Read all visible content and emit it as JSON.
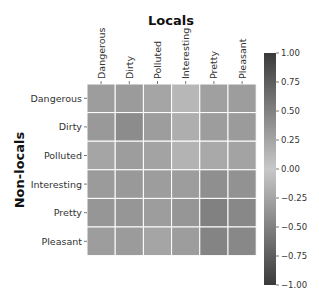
{
  "chart_data": {
    "type": "heatmap",
    "title": "Locals",
    "xlabel": "Locals",
    "ylabel": "Non-locals",
    "x_categories": [
      "Dangerous",
      "Dirty",
      "Polluted",
      "Interesting",
      "Pretty",
      "Pleasant"
    ],
    "y_categories": [
      "Dangerous",
      "Dirty",
      "Polluted",
      "Interesting",
      "Pretty",
      "Pleasant"
    ],
    "values": [
      [
        0.3,
        0.32,
        0.25,
        0.12,
        0.28,
        0.3
      ],
      [
        0.33,
        0.42,
        0.3,
        0.18,
        0.3,
        0.32
      ],
      [
        0.25,
        0.3,
        0.26,
        0.15,
        0.22,
        0.26
      ],
      [
        0.32,
        0.33,
        0.3,
        0.3,
        0.4,
        0.38
      ],
      [
        0.35,
        0.35,
        0.3,
        0.35,
        0.5,
        0.45
      ],
      [
        0.3,
        0.32,
        0.25,
        0.3,
        0.48,
        0.45
      ]
    ],
    "colorbar": {
      "range": [
        -1.0,
        1.0
      ],
      "ticks": [
        "1.00",
        "0.75",
        "0.50",
        "0.25",
        "0.00",
        "−0.25",
        "−0.50",
        "−0.75",
        "−1.00"
      ],
      "tick_values": [
        1.0,
        0.75,
        0.5,
        0.25,
        0.0,
        -0.25,
        -0.5,
        -0.75,
        -1.0
      ],
      "colormap": "diverging-grayscale",
      "color_extreme": "#3a3a3a",
      "color_center": "#c8c8c8"
    },
    "grid_line_color": "#ffffff"
  }
}
